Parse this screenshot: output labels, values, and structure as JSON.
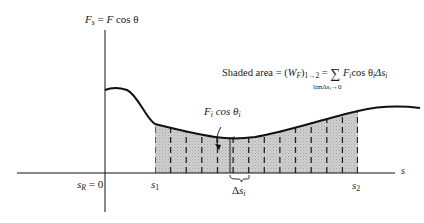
{
  "figure": {
    "y_axis_label": {
      "var": "F",
      "sub": "s",
      "eq": " = ",
      "rhs_var": "F",
      "rhs_fn": " cos θ"
    },
    "x_axis_label": "s",
    "origin_label": {
      "var": "s",
      "sub": "R",
      "rest": " = 0"
    },
    "s1_label": {
      "var": "s",
      "sub": "1"
    },
    "s2_label": {
      "var": "s",
      "sub": "2"
    },
    "force_label": {
      "var": "F",
      "sub": "i",
      "mid": " cos θ",
      "sub2": "i"
    },
    "delta_label": {
      "pre": "Δ",
      "var": "s",
      "sub": "i"
    },
    "area_formula": {
      "prefix": "Shaded area = (",
      "W": "W",
      "Wsub": "F",
      "close": ")",
      "range": "1→2",
      "eq": " = ",
      "sum": "∑",
      "limit": "limΔs",
      "limit_sub": "i",
      "limit_tail": "→0",
      "term_F": "F",
      "term_Fsub": "i",
      "term_cos": "cos θ",
      "term_thsub": "i",
      "term_ds": "Δs",
      "term_dssub": "i"
    },
    "colors": {
      "line": "#111111",
      "shade": "#c8c8c8",
      "dash": "#222222",
      "background": "#ffffff"
    },
    "dash_count": 14
  }
}
